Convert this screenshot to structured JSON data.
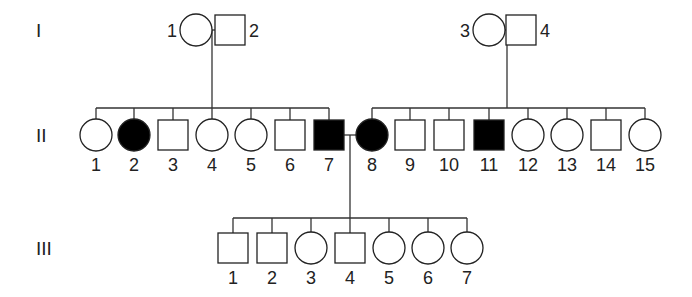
{
  "pedigree": {
    "generations": [
      {
        "label": "I",
        "y": 30
      },
      {
        "label": "II",
        "y": 135
      },
      {
        "label": "III",
        "y": 248
      }
    ],
    "gen1": [
      {
        "id": "1",
        "sex": "female",
        "affected": false,
        "x": 196,
        "label_side": "left"
      },
      {
        "id": "2",
        "sex": "male",
        "affected": false,
        "x": 230,
        "label_side": "right"
      },
      {
        "id": "3",
        "sex": "female",
        "affected": false,
        "x": 489,
        "label_side": "left"
      },
      {
        "id": "4",
        "sex": "male",
        "affected": false,
        "x": 521,
        "label_side": "right"
      }
    ],
    "gen2": [
      {
        "id": "1",
        "sex": "female",
        "affected": false,
        "x": 96
      },
      {
        "id": "2",
        "sex": "female",
        "affected": true,
        "x": 134
      },
      {
        "id": "3",
        "sex": "male",
        "affected": false,
        "x": 173
      },
      {
        "id": "4",
        "sex": "female",
        "affected": false,
        "x": 212
      },
      {
        "id": "5",
        "sex": "female",
        "affected": false,
        "x": 251
      },
      {
        "id": "6",
        "sex": "male",
        "affected": false,
        "x": 290
      },
      {
        "id": "7",
        "sex": "male",
        "affected": true,
        "x": 329
      },
      {
        "id": "8",
        "sex": "female",
        "affected": true,
        "x": 372
      },
      {
        "id": "9",
        "sex": "male",
        "affected": false,
        "x": 410
      },
      {
        "id": "10",
        "sex": "male",
        "affected": false,
        "x": 449
      },
      {
        "id": "11",
        "sex": "male",
        "affected": true,
        "x": 489
      },
      {
        "id": "12",
        "sex": "female",
        "affected": false,
        "x": 528
      },
      {
        "id": "13",
        "sex": "female",
        "affected": false,
        "x": 567
      },
      {
        "id": "14",
        "sex": "male",
        "affected": false,
        "x": 606
      },
      {
        "id": "15",
        "sex": "female",
        "affected": false,
        "x": 645
      }
    ],
    "gen3": [
      {
        "id": "1",
        "sex": "male",
        "affected": false,
        "x": 233
      },
      {
        "id": "2",
        "sex": "male",
        "affected": false,
        "x": 272
      },
      {
        "id": "3",
        "sex": "female",
        "affected": false,
        "x": 311
      },
      {
        "id": "4",
        "sex": "male",
        "affected": false,
        "x": 350
      },
      {
        "id": "5",
        "sex": "female",
        "affected": false,
        "x": 389
      },
      {
        "id": "6",
        "sex": "female",
        "affected": false,
        "x": 428
      },
      {
        "id": "7",
        "sex": "female",
        "affected": false,
        "x": 467
      }
    ],
    "matings": [
      {
        "between": [
          "I-1",
          "I-2"
        ],
        "children": "II-1..II-7"
      },
      {
        "between": [
          "I-3",
          "I-4"
        ],
        "children": "II-8..II-15"
      },
      {
        "between": [
          "II-7",
          "II-8"
        ],
        "children": "III-1..III-7"
      }
    ],
    "colors": {
      "line": "#333333",
      "affected_fill": "#000000",
      "unaffected_fill": "#ffffff"
    }
  }
}
